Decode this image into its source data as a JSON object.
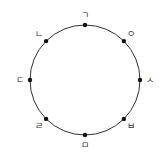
{
  "diagram": {
    "type": "circle-with-labeled-points",
    "stroke_color": "#333333",
    "point_color": "#111111",
    "points": [
      {
        "label": "ㄱ",
        "position": "top",
        "angle_deg": 90
      },
      {
        "label": "ㅇ",
        "position": "upper-right",
        "angle_deg": 45
      },
      {
        "label": "ㅅ",
        "position": "right",
        "angle_deg": 0
      },
      {
        "label": "ㅂ",
        "position": "lower-right",
        "angle_deg": -45
      },
      {
        "label": "ㅁ",
        "position": "bottom",
        "angle_deg": -90
      },
      {
        "label": "ㄹ",
        "position": "lower-left",
        "angle_deg": -135
      },
      {
        "label": "ㄷ",
        "position": "left",
        "angle_deg": 180
      },
      {
        "label": "ㄴ",
        "position": "upper-left",
        "angle_deg": 135
      }
    ]
  }
}
